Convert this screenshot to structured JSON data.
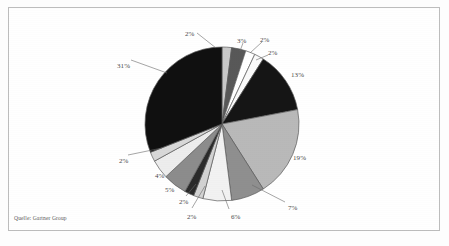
{
  "document": {
    "source_note": "Quelle: Gartner Group",
    "frame_color": "#bdbdbd",
    "background_color": "#ffffff"
  },
  "chart_data": {
    "type": "pie",
    "title": "",
    "subtitle": "",
    "xlabel": "",
    "ylabel": "",
    "legend_position": "none",
    "grid": false,
    "units": "percent",
    "total": 100,
    "start_angle_deg": -90,
    "direction": "clockwise",
    "categories": [
      "Slice 1",
      "Slice 2",
      "Slice 3",
      "Slice 4",
      "Slice 5",
      "Slice 6",
      "Slice 7",
      "Slice 8",
      "Slice 9",
      "Slice 10",
      "Slice 11",
      "Slice 12",
      "Slice 13",
      "Slice 14"
    ],
    "values": [
      2,
      3,
      2,
      2,
      13,
      19,
      7,
      6,
      2,
      2,
      5,
      4,
      2,
      31
    ],
    "value_labels": [
      "2%",
      "3%",
      "2%",
      "2%",
      "13%",
      "19%",
      "7%",
      "6%",
      "2%",
      "2%",
      "5%",
      "4%",
      "2%",
      "31%"
    ],
    "colors": [
      "#c9c9c9",
      "#585858",
      "#ffffff",
      "#fafafa",
      "#151515",
      "#b9b9b9",
      "#8f8f8f",
      "#f2f2f2",
      "#d2d2d2",
      "#2a2a2a",
      "#8c8c8c",
      "#ededed",
      "#d8d8d8",
      "#101010"
    ],
    "slice_outline_color": "#5a5a5a"
  },
  "labels": [
    {
      "text": "2%",
      "x": 185,
      "y": 30
    },
    {
      "text": "3%",
      "x": 237,
      "y": 37
    },
    {
      "text": "2%",
      "x": 260,
      "y": 36
    },
    {
      "text": "2%",
      "x": 268,
      "y": 49
    },
    {
      "text": "13%",
      "x": 291,
      "y": 71
    },
    {
      "text": "19%",
      "x": 293,
      "y": 154
    },
    {
      "text": "7%",
      "x": 288,
      "y": 204
    },
    {
      "text": "6%",
      "x": 231,
      "y": 213
    },
    {
      "text": "2%",
      "x": 187,
      "y": 213
    },
    {
      "text": "2%",
      "x": 179,
      "y": 198
    },
    {
      "text": "5%",
      "x": 165,
      "y": 186
    },
    {
      "text": "4%",
      "x": 155,
      "y": 172
    },
    {
      "text": "2%",
      "x": 119,
      "y": 157
    },
    {
      "text": "31%",
      "x": 117,
      "y": 62
    }
  ],
  "leader_lines": [
    {
      "name": "leader-2pct-top",
      "x1": 197,
      "y1": 33,
      "x2": 216,
      "y2": 48
    },
    {
      "name": "leader-3pct",
      "x1": 243,
      "y1": 43,
      "x2": 240,
      "y2": 51
    },
    {
      "name": "leader-2pct-a",
      "x1": 262,
      "y1": 42,
      "x2": 250,
      "y2": 53
    },
    {
      "name": "leader-2pct-b",
      "x1": 268,
      "y1": 55,
      "x2": 256,
      "y2": 60
    },
    {
      "name": "leader-7pct",
      "x1": 285,
      "y1": 202,
      "x2": 252,
      "y2": 185
    },
    {
      "name": "leader-6pct",
      "x1": 229,
      "y1": 209,
      "x2": 222,
      "y2": 190
    },
    {
      "name": "leader-2pct-c",
      "x1": 192,
      "y1": 208,
      "x2": 205,
      "y2": 186
    },
    {
      "name": "leader-2pct-d",
      "x1": 186,
      "y1": 196,
      "x2": 196,
      "y2": 184
    },
    {
      "name": "leader-2pct-left",
      "x1": 128,
      "y1": 155,
      "x2": 162,
      "y2": 148
    },
    {
      "name": "leader-31pct",
      "x1": 131,
      "y1": 60,
      "x2": 167,
      "y2": 73
    }
  ]
}
